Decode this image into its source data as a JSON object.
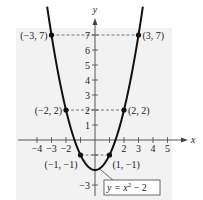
{
  "chart_data": {
    "type": "line",
    "title": "",
    "equation": "y = x^2 - 2",
    "equation_label": {
      "prefix": "y = x",
      "exp": "2",
      "suffix": " − 2"
    },
    "xlabel": "x",
    "ylabel": "y",
    "xlim": [
      -4.5,
      5.5
    ],
    "ylim": [
      -3.5,
      8
    ],
    "x_ticks": [
      -4,
      -3,
      -2,
      -1,
      1,
      2,
      3,
      4,
      5
    ],
    "x_tick_labels": [
      "−4",
      "−3",
      "−2",
      "2",
      "3",
      "4",
      "5"
    ],
    "y_ticks": [
      -3,
      -2,
      -1,
      1,
      2,
      3,
      4,
      5,
      6,
      7
    ],
    "y_tick_labels": [
      "−3",
      "1",
      "2",
      "3",
      "4",
      "5",
      "6",
      "7"
    ],
    "grid": false,
    "points": [
      {
        "x": -3,
        "y": 7,
        "label": "(−3, 7)"
      },
      {
        "x": 3,
        "y": 7,
        "label": "(3, 7)"
      },
      {
        "x": -2,
        "y": 2,
        "label": "(−2, 2)"
      },
      {
        "x": 2,
        "y": 2,
        "label": "(2, 2)"
      },
      {
        "x": -1,
        "y": -1,
        "label": "(−1, −1)"
      },
      {
        "x": 1,
        "y": -1,
        "label": "(1, −1)"
      }
    ],
    "background": "#f2f2f2",
    "curve_color": "#111111"
  }
}
